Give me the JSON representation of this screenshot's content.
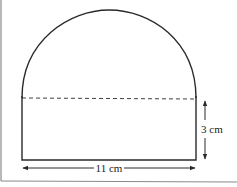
{
  "diagram": {
    "shape": "rectangle surmounted by semicircle",
    "rectangle": {
      "width_label": "11 cm",
      "height_label": "3 cm"
    },
    "semicircle": {
      "diameter_label": "11 cm"
    },
    "divider": "dashed line separating semicircle and rectangle"
  },
  "labels": {
    "width": "11 cm",
    "height": "3 cm"
  },
  "colors": {
    "stroke": "#2a2a2a",
    "frame": "#8a8a8a",
    "background": "#ffffff"
  }
}
